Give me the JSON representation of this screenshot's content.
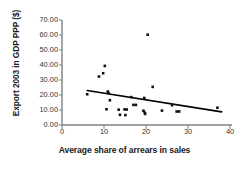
{
  "chart_data": {
    "type": "scatter",
    "title": "",
    "xlabel": "Average share of arrears in sales",
    "ylabel": "Export 2003 in GDP PPP ($)",
    "xlim": [
      0,
      40
    ],
    "ylim": [
      0,
      70
    ],
    "xticks": [
      "0",
      "10",
      "20",
      "30",
      "40"
    ],
    "xtick_values": [
      0,
      10,
      20,
      30,
      40
    ],
    "yticks": [
      "0.00",
      "10.00",
      "20.00",
      "30.00",
      "40.00",
      "50.00",
      "60.00",
      "70.00"
    ],
    "ytick_values": [
      0,
      10,
      20,
      30,
      40,
      50,
      60,
      70
    ],
    "grid": false,
    "legend": false,
    "marker": "square",
    "marker_color": "#111111",
    "series": [
      {
        "name": "Countries",
        "points": [
          [
            6.0,
            20.5
          ],
          [
            8.8,
            32.3
          ],
          [
            9.8,
            34.5
          ],
          [
            10.2,
            39.4
          ],
          [
            10.6,
            10.5
          ],
          [
            10.9,
            22.3
          ],
          [
            11.1,
            21.3
          ],
          [
            11.4,
            16.5
          ],
          [
            13.5,
            10.2
          ],
          [
            13.8,
            6.8
          ],
          [
            14.9,
            10.4
          ],
          [
            15.1,
            6.6
          ],
          [
            15.4,
            10.3
          ],
          [
            16.5,
            18.6
          ],
          [
            17.0,
            13.4
          ],
          [
            17.6,
            13.4
          ],
          [
            19.4,
            9.5
          ],
          [
            19.6,
            18.0
          ],
          [
            19.7,
            8.2
          ],
          [
            19.8,
            7.4
          ],
          [
            20.4,
            60.2
          ],
          [
            21.6,
            25.4
          ],
          [
            23.8,
            9.6
          ],
          [
            26.2,
            13.2
          ],
          [
            27.3,
            9.0
          ],
          [
            27.9,
            9.0
          ],
          [
            37.0,
            11.5
          ]
        ]
      }
    ],
    "trendline": {
      "type": "linear",
      "x_start": 6.0,
      "y_start": 23.0,
      "x_end": 38.0,
      "y_end": 8.8,
      "color": "#000000"
    }
  }
}
